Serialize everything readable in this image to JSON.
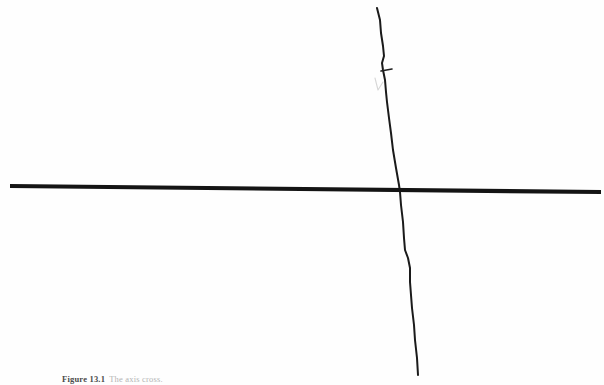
{
  "page": {
    "background_color": "#fefefe",
    "width": 604,
    "height": 385
  },
  "figure": {
    "ink_color": "#1a1a1a",
    "faint_ink_color": "#9a9a9a",
    "elements": {
      "horizontal_axis": {
        "name": "horizontal-baseline",
        "description": "Thick nearly-horizontal hand-ruled line spanning the full width",
        "start": [
          10,
          186
        ],
        "end": [
          601,
          192
        ],
        "stroke_width": 4.2
      },
      "vertical_axis": {
        "name": "vertical-wavy-line",
        "description": "Thin freehand wavy vertical line crossing the baseline",
        "start": [
          377,
          8
        ],
        "end": [
          418,
          375
        ],
        "stroke_width": 2.0,
        "waypoints": [
          [
            377,
            8
          ],
          [
            380,
            20
          ],
          [
            381,
            33
          ],
          [
            383,
            46
          ],
          [
            384,
            56
          ],
          [
            382,
            63
          ],
          [
            383,
            70
          ],
          [
            385,
            80
          ],
          [
            386,
            92
          ],
          [
            387,
            102
          ],
          [
            389,
            118
          ],
          [
            391,
            133
          ],
          [
            393,
            150
          ],
          [
            396,
            168
          ],
          [
            399,
            185
          ],
          [
            400,
            192
          ],
          [
            401,
            205
          ],
          [
            403,
            222
          ],
          [
            404,
            238
          ],
          [
            405,
            250
          ],
          [
            408,
            258
          ],
          [
            410,
            268
          ],
          [
            410,
            282
          ],
          [
            411,
            295
          ],
          [
            412,
            308
          ],
          [
            414,
            325
          ],
          [
            415,
            340
          ],
          [
            417,
            358
          ],
          [
            418,
            375
          ]
        ]
      },
      "tick_mark": {
        "name": "tick-mark",
        "description": "Short horizontal tick crossing the vertical line near the top",
        "start": [
          381,
          71
        ],
        "end": [
          392,
          69
        ],
        "stroke_width": 1.6
      },
      "faint_check_mark": {
        "name": "faint-check-mark",
        "description": "Very light pencil v/check stroke just left of the vertical line",
        "points": [
          [
            375,
            78
          ],
          [
            378,
            90
          ],
          [
            383,
            82
          ]
        ],
        "stroke_width": 1.1,
        "opacity": 0.33
      }
    },
    "intersection_point": [
      400,
      190
    ]
  },
  "caption": {
    "label": "Figure 13.1",
    "text": "The axis cross."
  }
}
